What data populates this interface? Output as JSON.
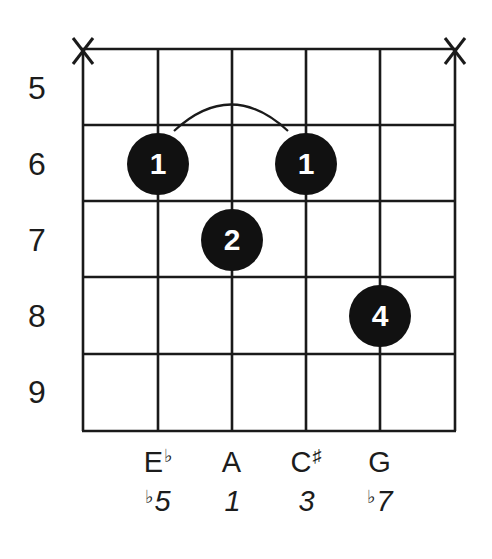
{
  "diagram": {
    "chord_hint": "A7b5",
    "strings_count": 6,
    "frets_shown": 5,
    "start_fret": 5,
    "colors": {
      "line": "#1a1a1a",
      "dot": "#111111",
      "dot_text": "#ffffff",
      "background": "#ffffff"
    },
    "string_x": [
      83,
      158,
      232,
      306,
      380,
      455
    ],
    "fret_y": [
      49,
      125,
      201,
      277,
      354,
      431
    ],
    "fret_numbers": [
      {
        "label": "5",
        "y": 72
      },
      {
        "label": "6",
        "y": 148
      },
      {
        "label": "7",
        "y": 224
      },
      {
        "label": "8",
        "y": 300
      },
      {
        "label": "9",
        "y": 376
      }
    ],
    "muted_strings": [
      {
        "string": 1,
        "symbol": "X"
      },
      {
        "string": 6,
        "symbol": "X"
      }
    ],
    "fingers": [
      {
        "string": 2,
        "fret": 6,
        "finger": "1"
      },
      {
        "string": 4,
        "fret": 6,
        "finger": "1"
      },
      {
        "string": 3,
        "fret": 7,
        "finger": "2"
      },
      {
        "string": 5,
        "fret": 8,
        "finger": "4"
      }
    ],
    "barre": {
      "from_string": 2,
      "to_string": 4,
      "fret": 6,
      "shape": "arc"
    },
    "notes": [
      {
        "string": 2,
        "name": "E",
        "accidental": "♭"
      },
      {
        "string": 3,
        "name": "A",
        "accidental": ""
      },
      {
        "string": 4,
        "name": "C",
        "accidental": "♯"
      },
      {
        "string": 5,
        "name": "G",
        "accidental": ""
      }
    ],
    "intervals": [
      {
        "string": 2,
        "prefix": "♭",
        "degree": "5"
      },
      {
        "string": 3,
        "prefix": "",
        "degree": "1"
      },
      {
        "string": 4,
        "prefix": "",
        "degree": "3"
      },
      {
        "string": 5,
        "prefix": "♭",
        "degree": "7"
      }
    ]
  }
}
